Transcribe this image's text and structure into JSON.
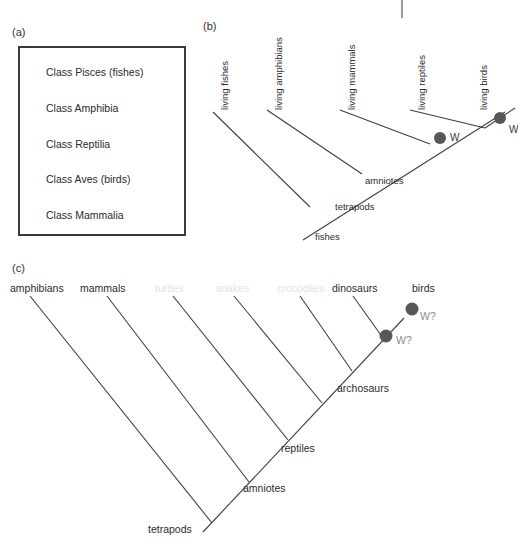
{
  "figure": {
    "corner_mark": "tick-mark"
  },
  "panel_a": {
    "letter": "(a)",
    "items": [
      "Class Pisces (fishes)",
      "Class Amphibia",
      "Class Reptilia",
      "Class Aves (birds)",
      "Class Mammalia"
    ]
  },
  "panel_b": {
    "letter": "(b)",
    "tips": [
      "living fishes",
      "living amphibians",
      "living mammals",
      "living reptiles",
      "living birds"
    ],
    "nodes": [
      "fishes",
      "tetrapods",
      "amniotes"
    ],
    "markers": [
      {
        "label": "W",
        "on_branch": "living mammals"
      },
      {
        "label": "W",
        "on_branch": "living birds"
      }
    ]
  },
  "panel_c": {
    "letter": "(c)",
    "tips": [
      {
        "label": "amphibians",
        "faded": false
      },
      {
        "label": "mammals",
        "faded": false
      },
      {
        "label": "turtles",
        "faded": true
      },
      {
        "label": "snakes",
        "faded": true
      },
      {
        "label": "crocodiles",
        "faded": true
      },
      {
        "label": "dinosaurs",
        "faded": false
      },
      {
        "label": "birds",
        "faded": false
      }
    ],
    "nodes": [
      "tetrapods",
      "amniotes",
      "reptiles",
      "archosaurs"
    ],
    "markers": [
      {
        "label": "W?",
        "on_branch": "archosaurs-dinosaurs"
      },
      {
        "label": "W?",
        "on_branch": "birds"
      }
    ]
  },
  "colors": {
    "line": "#3f3f3f",
    "text": "#2b2b2b",
    "faded_text": "#e2e2e2",
    "marker_fill": "#575757",
    "marker_text": "#8d8d8d",
    "box_border": "#3a3a3a"
  }
}
